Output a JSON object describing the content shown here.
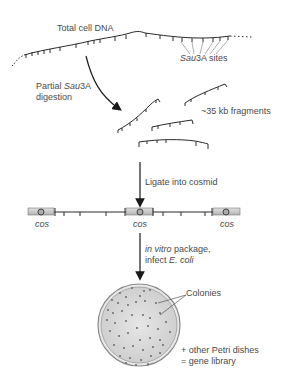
{
  "diagram": {
    "steps": {
      "genomic_dna": {
        "label": "Total cell DNA",
        "sites_label_italic": "Sau",
        "sites_label_rest": "3A sites"
      },
      "digestion": {
        "label_line1_plain": "Partial ",
        "label_line1_italic": "Sau",
        "label_line1_rest": "3A",
        "label_line2": "digestion"
      },
      "fragments": {
        "label": "~35 kb fragments"
      },
      "ligation": {
        "label": "Ligate into cosmid"
      },
      "cosmid": {
        "cos_labels": [
          "cos",
          "cos",
          "cos"
        ]
      },
      "packaging": {
        "label_line1_italic": "in vitro",
        "label_line1_rest": " package,",
        "label_line2_plain": "infect ",
        "label_line2_italic": "E. coli"
      },
      "plate": {
        "colonies_label": "Colonies",
        "note_line1": "+ other Petri dishes",
        "note_line2": "= gene library"
      }
    },
    "colors": {
      "line": "#2a2a2a",
      "text": "#4a4a4a",
      "cos_box": "#c8c8c8",
      "dish_fill": "#dcdcdc",
      "dish_rim": "#888888",
      "colony": "#6a6a6a"
    }
  }
}
